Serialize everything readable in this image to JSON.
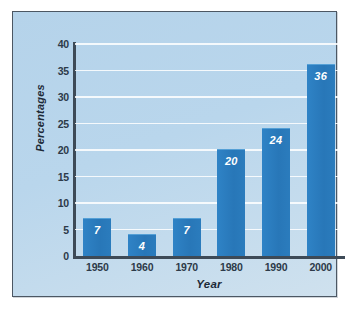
{
  "chart_data": {
    "type": "bar",
    "title": "",
    "subtitle": "",
    "xlabel": "Year",
    "ylabel": "Percentages",
    "categories": [
      "1950",
      "1960",
      "1970",
      "1980",
      "1990",
      "2000"
    ],
    "values": [
      7,
      4,
      7,
      20,
      24,
      36
    ],
    "data_labels": [
      "7",
      "4",
      "7",
      "20",
      "24",
      "36"
    ],
    "ylim": [
      0,
      40
    ],
    "ytick_labels": [
      "0",
      "5",
      "10",
      "15",
      "20",
      "25",
      "30",
      "35",
      "40"
    ],
    "ytick_values": [
      0,
      5,
      10,
      15,
      20,
      25,
      30,
      35,
      40
    ],
    "grid": true,
    "grid_axis": "y",
    "legend": false,
    "legend_position": "none",
    "series": [
      {
        "name": "Percentages",
        "values": [
          7,
          4,
          7,
          20,
          24,
          36
        ]
      }
    ],
    "colors": {
      "bar": "#2b7fc2",
      "bar_highlight": "#55a0d6",
      "plot_background": "#b8d4ea",
      "gridline": "#ffffff",
      "axis_line": "#3d4a57",
      "frame_border": "#4c5763",
      "tick_text": "#2d3a49",
      "axis_title_text": "#1d2a38",
      "data_label_text": "#ffffff",
      "page_background": "#ffffff"
    }
  }
}
